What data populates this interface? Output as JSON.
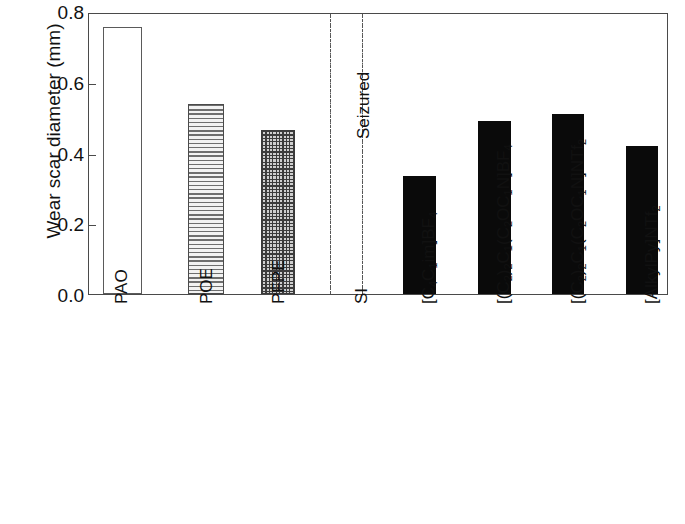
{
  "chart_data": {
    "type": "bar",
    "title": "",
    "xlabel": "",
    "ylabel": "Wear scar diameter (mm)",
    "ylim": [
      0.0,
      0.8
    ],
    "ytick_labels": [
      "0.8",
      "0.6",
      "0.4",
      "0.2",
      "0.0"
    ],
    "ytick_values": [
      0.8,
      0.6,
      0.4,
      0.2,
      0.0
    ],
    "grid": false,
    "legend": "none",
    "categories": [
      "PAO",
      "POE",
      "PFPE",
      "SI",
      "[C4C1im]BF4",
      "[(C2)2C1(C2OC1N]BF4",
      "[(C2)2C1(C2OC1N]NTf2",
      "[AlkylPy]NTf2"
    ],
    "values": [
      0.757,
      0.54,
      0.465,
      0.0,
      0.335,
      0.492,
      0.51,
      0.42
    ],
    "bar_styles": [
      "hollow",
      "hlines",
      "grid",
      "none",
      "solid",
      "solid",
      "solid",
      "solid"
    ],
    "annotations": [
      {
        "text": "Seizured",
        "rotated": true,
        "between_categories": [
          "PFPE",
          "SI"
        ]
      }
    ]
  },
  "axis": {
    "y_title": "Wear scar diameter (mm)",
    "y_ticks": [
      {
        "label": "0.8",
        "value": 0.8
      },
      {
        "label": "0.6",
        "value": 0.6
      },
      {
        "label": "0.4",
        "value": 0.4
      },
      {
        "label": "0.2",
        "value": 0.2
      },
      {
        "label": "0.0",
        "value": 0.0
      }
    ]
  },
  "x_labels": [
    {
      "plain": "PAO",
      "parts": [
        {
          "t": "PAO"
        }
      ]
    },
    {
      "plain": "POE",
      "parts": [
        {
          "t": "POE"
        }
      ]
    },
    {
      "plain": "PFPE",
      "parts": [
        {
          "t": "PFPE"
        }
      ]
    },
    {
      "plain": "SI",
      "parts": [
        {
          "t": "SI"
        }
      ]
    },
    {
      "plain": "[C4C1im]BF4",
      "parts": [
        {
          "t": "[C"
        },
        {
          "t": "4",
          "sub": true
        },
        {
          "t": "C"
        },
        {
          "t": "1",
          "sub": true
        },
        {
          "t": "im]BF"
        },
        {
          "t": "4",
          "sub": true
        }
      ]
    },
    {
      "plain": "[(C2)2C1(C2OC1N]BF4",
      "parts": [
        {
          "t": "[(C"
        },
        {
          "t": "2",
          "sub": true
        },
        {
          "t": ")"
        },
        {
          "t": "2",
          "sub": true
        },
        {
          "t": "C"
        },
        {
          "t": "1",
          "sub": true
        },
        {
          "t": "(C"
        },
        {
          "t": "2",
          "sub": true
        },
        {
          "t": "OC"
        },
        {
          "t": "1",
          "sub": true
        },
        {
          "t": "N]BF"
        },
        {
          "t": "4",
          "sub": true
        }
      ]
    },
    {
      "plain": "[(C2)2C1(C2OC1N]NTf2",
      "parts": [
        {
          "t": "[(C"
        },
        {
          "t": "2",
          "sub": true
        },
        {
          "t": ")"
        },
        {
          "t": "2",
          "sub": true
        },
        {
          "t": "C"
        },
        {
          "t": "1",
          "sub": true
        },
        {
          "t": "(C"
        },
        {
          "t": "2",
          "sub": true
        },
        {
          "t": "OC"
        },
        {
          "t": "1",
          "sub": true
        },
        {
          "t": "N]NTf"
        },
        {
          "t": "2",
          "sub": true
        }
      ]
    },
    {
      "plain": "[AlkylPy]NTf2",
      "parts": [
        {
          "t": "[AlkylPy]NTf"
        },
        {
          "t": "2",
          "sub": true
        }
      ]
    }
  ],
  "annotation": {
    "seizured_label": "Seizured"
  },
  "colors": {
    "frame": "#4a4a4a",
    "bar_solid": "#0a0a0a",
    "bar_hollow_border": "#5a5a5a",
    "hatch": "#3c3c3c",
    "text": "#111111",
    "background": "#ffffff",
    "seizure_line": "#555555"
  }
}
